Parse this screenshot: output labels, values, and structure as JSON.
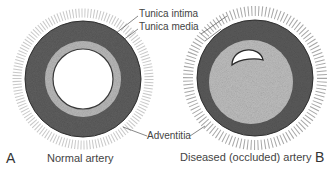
{
  "labels": {
    "tunica_intima": "Tunica intima",
    "tunica_media": "Tunica media",
    "adventitia": "Adventitia"
  },
  "panels": [
    {
      "letter": "A",
      "caption": "Normal artery"
    },
    {
      "letter": "B",
      "caption": "Diseased (occluded) artery"
    }
  ],
  "colors": {
    "media": "#5e5e5e",
    "intima_normal": "#b8b8b8",
    "plaque": "#bdbdbd",
    "adventitia_dots": "#555555",
    "lumen": "#ffffff"
  }
}
